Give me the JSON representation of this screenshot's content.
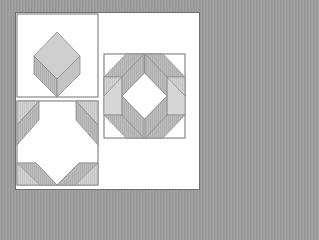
{
  "figure": {
    "panels": [
      {
        "id": "unit",
        "label": "Single cube unit"
      },
      {
        "id": "corner-block",
        "label": "Corner block"
      },
      {
        "id": "finished-block",
        "label": "Finished block"
      }
    ]
  },
  "colors": {
    "background": "#9a9a9a",
    "panel": "#ffffff",
    "outline": "#6e6e6e",
    "light_face": "#d4d4d4",
    "mid_face": "#bdbdbd",
    "dark_face": "#a9a9a9"
  }
}
